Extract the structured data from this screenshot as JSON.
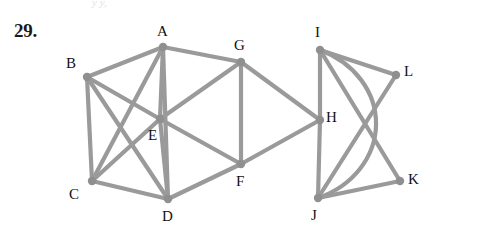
{
  "figure": {
    "exercise_number": "29.",
    "top_fragment": "y   y,",
    "edge_color": "#9a9a9a",
    "node_color": "#8f8f8f",
    "label_color": "#111111",
    "background": "#ffffff",
    "edge_width": 4.2,
    "node_radius": 4.2
  },
  "graph_data": {
    "type": "node-link-diagram",
    "vertices": [
      {
        "id": "A",
        "x": 163,
        "y": 47,
        "label": "A",
        "label_x": 157,
        "label_y": 24
      },
      {
        "id": "B",
        "x": 87,
        "y": 77,
        "label": "B",
        "label_x": 66,
        "label_y": 56
      },
      {
        "id": "C",
        "x": 92,
        "y": 181,
        "label": "C",
        "label_x": 69,
        "label_y": 187
      },
      {
        "id": "D",
        "x": 168,
        "y": 199,
        "label": "D",
        "label_x": 162,
        "label_y": 209
      },
      {
        "id": "E",
        "x": 160,
        "y": 119,
        "label": "E",
        "label_x": 148,
        "label_y": 128
      },
      {
        "id": "F",
        "x": 241,
        "y": 164,
        "label": "F",
        "label_x": 236,
        "label_y": 174
      },
      {
        "id": "G",
        "x": 241,
        "y": 62,
        "label": "G",
        "label_x": 234,
        "label_y": 38
      },
      {
        "id": "H",
        "x": 320,
        "y": 120,
        "label": "H",
        "label_x": 326,
        "label_y": 110
      },
      {
        "id": "I",
        "x": 320,
        "y": 50,
        "label": "I",
        "label_x": 315,
        "label_y": 25
      },
      {
        "id": "J",
        "x": 318,
        "y": 198,
        "label": "J",
        "label_x": 311,
        "label_y": 208
      },
      {
        "id": "K",
        "x": 400,
        "y": 181,
        "label": "K",
        "label_x": 408,
        "label_y": 172
      },
      {
        "id": "L",
        "x": 396,
        "y": 75,
        "label": "L",
        "label_x": 404,
        "label_y": 64
      }
    ],
    "edges": [
      {
        "from": "A",
        "to": "B",
        "kind": "line"
      },
      {
        "from": "A",
        "to": "G",
        "kind": "line"
      },
      {
        "from": "A",
        "to": "E",
        "kind": "line"
      },
      {
        "from": "A",
        "to": "C",
        "kind": "line"
      },
      {
        "from": "A",
        "to": "D",
        "kind": "line"
      },
      {
        "from": "B",
        "to": "C",
        "kind": "line"
      },
      {
        "from": "B",
        "to": "E",
        "kind": "line"
      },
      {
        "from": "B",
        "to": "D",
        "kind": "line"
      },
      {
        "from": "C",
        "to": "D",
        "kind": "line"
      },
      {
        "from": "C",
        "to": "E",
        "kind": "line"
      },
      {
        "from": "D",
        "to": "E",
        "kind": "line"
      },
      {
        "from": "D",
        "to": "F",
        "kind": "line"
      },
      {
        "from": "E",
        "to": "G",
        "kind": "line"
      },
      {
        "from": "E",
        "to": "F",
        "kind": "line"
      },
      {
        "from": "G",
        "to": "F",
        "kind": "line"
      },
      {
        "from": "G",
        "to": "H",
        "kind": "line"
      },
      {
        "from": "F",
        "to": "H",
        "kind": "line"
      },
      {
        "from": "I",
        "to": "H",
        "kind": "line"
      },
      {
        "from": "H",
        "to": "J",
        "kind": "line"
      },
      {
        "from": "I",
        "to": "L",
        "kind": "line"
      },
      {
        "from": "I",
        "to": "K",
        "kind": "line"
      },
      {
        "from": "J",
        "to": "L",
        "kind": "line"
      },
      {
        "from": "J",
        "to": "K",
        "kind": "line"
      },
      {
        "from": "I",
        "to": "J",
        "kind": "arc",
        "arc_rx": 92,
        "arc_ry": 80,
        "arc_sweep": 1
      }
    ],
    "vertex_count": 12,
    "edge_count": 24
  }
}
